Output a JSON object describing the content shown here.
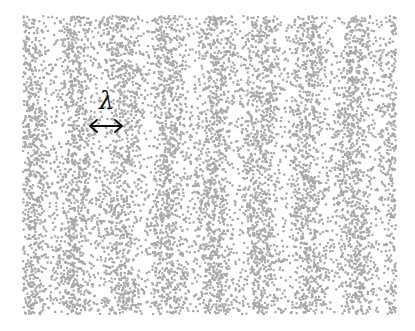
{
  "figure": {
    "width": 415,
    "height": 331,
    "background": "#ffffff",
    "region": {
      "x0": 22,
      "y0": 15,
      "x1": 395,
      "y1": 313
    },
    "dots": {
      "count": 9000,
      "color": "#a8a8a8",
      "size": 2.2,
      "seed": 7,
      "stripe_period_px": 46,
      "stripe_phase_px": 30,
      "stripe_contrast": 0.75
    },
    "annotation": {
      "symbol": "λ",
      "meaning": "wavelength",
      "arrow": "double-headed horizontal",
      "color": "#111111"
    }
  }
}
